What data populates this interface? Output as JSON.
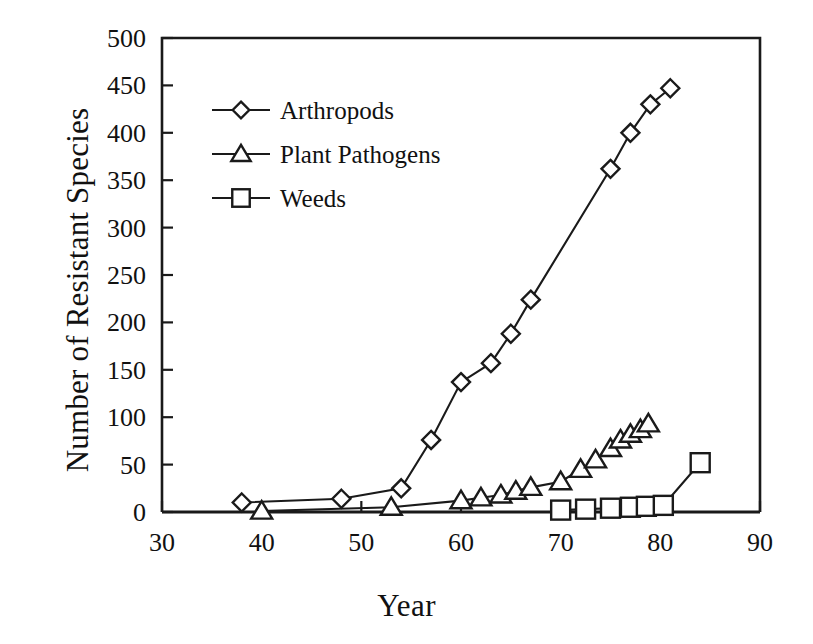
{
  "chart_data": {
    "type": "line",
    "title": "",
    "xlabel": "Year",
    "ylabel": "Number of Resistant Species",
    "xlim": [
      30,
      90
    ],
    "ylim": [
      0,
      500
    ],
    "xticks": [
      30,
      40,
      50,
      60,
      70,
      80,
      90
    ],
    "yticks": [
      0,
      50,
      100,
      150,
      200,
      250,
      300,
      350,
      400,
      450,
      500
    ],
    "xtick_labels": [
      "30",
      "40",
      "50",
      "60",
      "70",
      "80",
      "90"
    ],
    "ytick_labels": [
      "0",
      "50",
      "100",
      "150",
      "200",
      "250",
      "300",
      "350",
      "400",
      "450",
      "500"
    ],
    "grid": false,
    "legend_position": "upper-left-inside",
    "series": [
      {
        "name": "Arthropods",
        "marker": "diamond",
        "points": [
          {
            "x": 38,
            "y": 10
          },
          {
            "x": 48,
            "y": 14
          },
          {
            "x": 54,
            "y": 25
          },
          {
            "x": 57,
            "y": 76
          },
          {
            "x": 60,
            "y": 137
          },
          {
            "x": 63,
            "y": 157
          },
          {
            "x": 65,
            "y": 188
          },
          {
            "x": 67,
            "y": 224
          },
          {
            "x": 75,
            "y": 362
          },
          {
            "x": 77,
            "y": 400
          },
          {
            "x": 79,
            "y": 430
          },
          {
            "x": 81,
            "y": 447
          }
        ]
      },
      {
        "name": "Plant Pathogens",
        "marker": "triangle",
        "points": [
          {
            "x": 40,
            "y": 1
          },
          {
            "x": 53,
            "y": 5
          },
          {
            "x": 60,
            "y": 12
          },
          {
            "x": 62,
            "y": 15
          },
          {
            "x": 64,
            "y": 18
          },
          {
            "x": 65.5,
            "y": 22
          },
          {
            "x": 67,
            "y": 26
          },
          {
            "x": 70,
            "y": 32
          },
          {
            "x": 72,
            "y": 45
          },
          {
            "x": 73.5,
            "y": 55
          },
          {
            "x": 75,
            "y": 67
          },
          {
            "x": 76,
            "y": 76
          },
          {
            "x": 77,
            "y": 82
          },
          {
            "x": 78,
            "y": 87
          },
          {
            "x": 78.8,
            "y": 93
          }
        ]
      },
      {
        "name": "Weeds",
        "marker": "square",
        "points": [
          {
            "x": 70,
            "y": 2
          },
          {
            "x": 72.5,
            "y": 3
          },
          {
            "x": 75,
            "y": 4
          },
          {
            "x": 77,
            "y": 5
          },
          {
            "x": 78.6,
            "y": 6
          },
          {
            "x": 80.3,
            "y": 7
          },
          {
            "x": 84,
            "y": 52
          }
        ]
      }
    ]
  },
  "legend": {
    "items": [
      {
        "label": "Arthropods",
        "marker": "diamond"
      },
      {
        "label": "Plant Pathogens",
        "marker": "triangle"
      },
      {
        "label": "Weeds",
        "marker": "square"
      }
    ]
  },
  "axis": {
    "x_title": "Year",
    "y_title": "Number of Resistant Species"
  },
  "colors": {
    "ink": "#1a1a1a",
    "background": "#ffffff",
    "marker_fill": "#ffffff"
  }
}
